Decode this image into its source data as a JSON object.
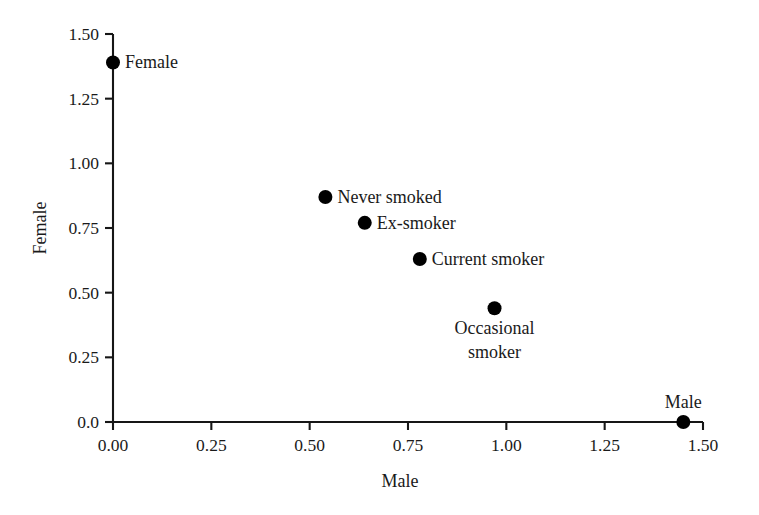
{
  "chart_data": {
    "type": "scatter",
    "title": "",
    "xlabel": "Male",
    "ylabel": "Female",
    "xlim": [
      0.0,
      1.5
    ],
    "ylim": [
      0.0,
      1.5
    ],
    "grid": false,
    "legend": "none",
    "xticks": [
      "0.00",
      "0.25",
      "0.50",
      "0.75",
      "1.00",
      "1.25",
      "1.50"
    ],
    "xtick_values": [
      0.0,
      0.25,
      0.5,
      0.75,
      1.0,
      1.25,
      1.5
    ],
    "yticks": [
      "0.0",
      "0.25",
      "0.50",
      "0.75",
      "1.00",
      "1.25",
      "1.50"
    ],
    "ytick_values": [
      0.0,
      0.25,
      0.5,
      0.75,
      1.0,
      1.25,
      1.5
    ],
    "marker_color": "#000000",
    "axis_color": "#161616",
    "background_color": "#ffffff",
    "points": [
      {
        "label": "Female",
        "x": 0.0,
        "y": 1.39,
        "label_pos": "right",
        "label_lines": [
          "Female"
        ]
      },
      {
        "label": "Never smoked",
        "x": 0.54,
        "y": 0.87,
        "label_pos": "right",
        "label_lines": [
          "Never smoked"
        ]
      },
      {
        "label": "Ex-smoker",
        "x": 0.64,
        "y": 0.77,
        "label_pos": "right",
        "label_lines": [
          "Ex-smoker"
        ]
      },
      {
        "label": "Current smoker",
        "x": 0.78,
        "y": 0.63,
        "label_pos": "right",
        "label_lines": [
          "Current smoker"
        ]
      },
      {
        "label": "Occasional smoker",
        "x": 0.97,
        "y": 0.44,
        "label_pos": "below",
        "label_lines": [
          "Occasional",
          "smoker"
        ]
      },
      {
        "label": "Male",
        "x": 1.45,
        "y": 0.0,
        "label_pos": "above",
        "label_lines": [
          "Male"
        ]
      }
    ]
  },
  "axes": {
    "x_title": "Male",
    "y_title": "Female"
  }
}
